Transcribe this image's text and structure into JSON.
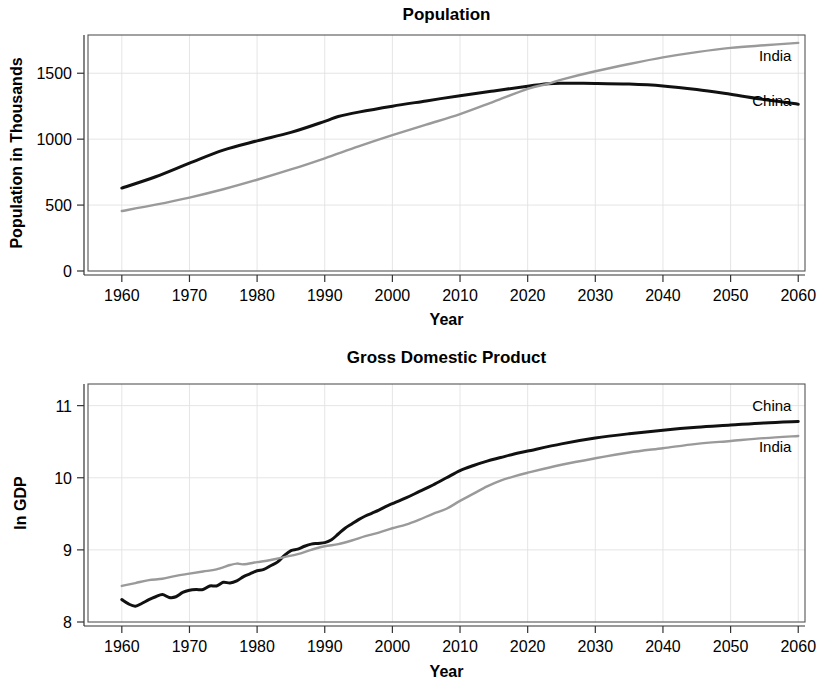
{
  "chart_data": [
    {
      "type": "line",
      "title": "Population",
      "xlabel": "Year",
      "ylabel": "Population in Thousands",
      "xlim": [
        1955,
        2061
      ],
      "ylim": [
        0,
        1790
      ],
      "xticks": [
        1960,
        1970,
        1980,
        1990,
        2000,
        2010,
        2020,
        2030,
        2040,
        2050,
        2060
      ],
      "xtick_labels": [
        "1960",
        "1970",
        "1980",
        "1990",
        "2000",
        "2010",
        "2020",
        "2030",
        "2040",
        "2050",
        "2060"
      ],
      "yticks": [
        0,
        500,
        1000,
        1500
      ],
      "ytick_labels": [
        "0",
        "500",
        "1000",
        "1500"
      ],
      "grid": true,
      "legend_position": "inline-right",
      "series": [
        {
          "name": "China",
          "label": "China",
          "color": "#111111",
          "width": 3.0,
          "label_x": 2059,
          "label_y": 1250,
          "x": [
            1960,
            1965,
            1970,
            1975,
            1980,
            1985,
            1990,
            1992,
            1995,
            2000,
            2005,
            2010,
            2015,
            2020,
            2023,
            2025,
            2030,
            2035,
            2040,
            2045,
            2050,
            2055,
            2060
          ],
          "values": [
            629,
            715,
            818,
            917,
            987,
            1051,
            1135,
            1172,
            1205,
            1250,
            1290,
            1330,
            1366,
            1402,
            1420,
            1424,
            1423,
            1418,
            1404,
            1377,
            1340,
            1300,
            1265
          ]
        },
        {
          "name": "India",
          "label": "India",
          "color": "#9a9a9a",
          "width": 2.4,
          "label_x": 2059,
          "label_y": 1590,
          "x": [
            1960,
            1965,
            1970,
            1975,
            1980,
            1985,
            1990,
            1995,
            2000,
            2005,
            2010,
            2015,
            2020,
            2023,
            2025,
            2030,
            2035,
            2040,
            2045,
            2050,
            2055,
            2060
          ],
          "values": [
            455,
            503,
            557,
            620,
            692,
            770,
            855,
            945,
            1030,
            1110,
            1190,
            1285,
            1382,
            1420,
            1452,
            1515,
            1570,
            1620,
            1660,
            1692,
            1712,
            1730
          ]
        }
      ]
    },
    {
      "type": "line",
      "title": "Gross Domestic Product",
      "xlabel": "Year",
      "ylabel": "ln GDP",
      "xlim": [
        1955,
        2061
      ],
      "ylim": [
        8,
        11.3
      ],
      "xticks": [
        1960,
        1970,
        1980,
        1990,
        2000,
        2010,
        2020,
        2030,
        2040,
        2050,
        2060
      ],
      "xtick_labels": [
        "1960",
        "1970",
        "1980",
        "1990",
        "2000",
        "2010",
        "2020",
        "2030",
        "2040",
        "2050",
        "2060"
      ],
      "yticks": [
        8,
        9,
        10,
        11
      ],
      "ytick_labels": [
        "8",
        "9",
        "10",
        "11"
      ],
      "grid": true,
      "legend_position": "inline-right",
      "series": [
        {
          "name": "China",
          "label": "China",
          "color": "#111111",
          "width": 3.0,
          "label_x": 2059,
          "label_y": 10.93,
          "x": [
            1960,
            1961,
            1962,
            1963,
            1964,
            1965,
            1966,
            1967,
            1968,
            1969,
            1970,
            1971,
            1972,
            1973,
            1974,
            1975,
            1976,
            1977,
            1978,
            1979,
            1980,
            1981,
            1982,
            1983,
            1984,
            1985,
            1986,
            1987,
            1988,
            1989,
            1990,
            1991,
            1992,
            1993,
            1994,
            1995,
            1996,
            1997,
            1998,
            1999,
            2000,
            2002,
            2004,
            2006,
            2008,
            2010,
            2012,
            2014,
            2016,
            2018,
            2020,
            2025,
            2030,
            2035,
            2040,
            2045,
            2050,
            2055,
            2060
          ],
          "values": [
            8.31,
            8.25,
            8.22,
            8.26,
            8.31,
            8.35,
            8.38,
            8.34,
            8.35,
            8.41,
            8.44,
            8.45,
            8.45,
            8.5,
            8.5,
            8.55,
            8.54,
            8.57,
            8.63,
            8.67,
            8.71,
            8.73,
            8.78,
            8.83,
            8.92,
            8.99,
            9.01,
            9.05,
            9.08,
            9.09,
            9.1,
            9.14,
            9.22,
            9.3,
            9.36,
            9.42,
            9.47,
            9.51,
            9.55,
            9.6,
            9.64,
            9.72,
            9.81,
            9.9,
            10.0,
            10.1,
            10.17,
            10.23,
            10.28,
            10.33,
            10.37,
            10.47,
            10.55,
            10.61,
            10.66,
            10.7,
            10.73,
            10.76,
            10.78
          ]
        },
        {
          "name": "India",
          "label": "India",
          "color": "#9a9a9a",
          "width": 2.4,
          "label_x": 2059,
          "label_y": 10.36,
          "x": [
            1960,
            1962,
            1964,
            1966,
            1968,
            1970,
            1972,
            1974,
            1976,
            1977,
            1978,
            1980,
            1982,
            1984,
            1986,
            1988,
            1990,
            1992,
            1994,
            1996,
            1998,
            2000,
            2002,
            2004,
            2006,
            2008,
            2010,
            2012,
            2014,
            2016,
            2018,
            2020,
            2025,
            2030,
            2035,
            2040,
            2045,
            2050,
            2055,
            2060
          ],
          "values": [
            8.5,
            8.54,
            8.58,
            8.6,
            8.64,
            8.67,
            8.7,
            8.73,
            8.79,
            8.81,
            8.8,
            8.83,
            8.86,
            8.9,
            8.94,
            9.0,
            9.05,
            9.08,
            9.13,
            9.19,
            9.24,
            9.3,
            9.35,
            9.42,
            9.5,
            9.57,
            9.68,
            9.78,
            9.88,
            9.96,
            10.02,
            10.07,
            10.18,
            10.27,
            10.35,
            10.41,
            10.47,
            10.51,
            10.55,
            10.58
          ]
        }
      ]
    }
  ]
}
